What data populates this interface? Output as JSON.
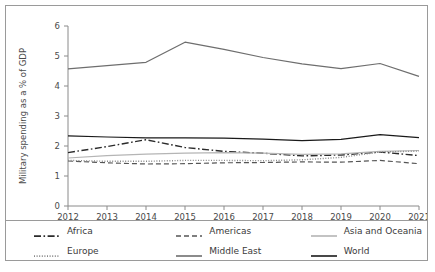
{
  "chart_data": {
    "type": "line",
    "title": "",
    "xlabel": "",
    "ylabel": "Military spending as a % of GDP",
    "x": [
      2012,
      2013,
      2014,
      2015,
      2016,
      2017,
      2018,
      2019,
      2020,
      2021
    ],
    "xticklabels": [
      "2012",
      "2013",
      "2014",
      "2015",
      "2016",
      "2017",
      "2018",
      "2019",
      "2020",
      "2021"
    ],
    "yticklabels": [
      "0",
      "1",
      "2",
      "3",
      "4",
      "5",
      "6"
    ],
    "ylim": [
      0,
      6
    ],
    "xlim": [
      2012,
      2021
    ],
    "grid": false,
    "legend_position": "bottom",
    "series": [
      {
        "name": "Africa",
        "style": "dash-dot",
        "color": "#2b2b2b",
        "values": [
          1.78,
          1.98,
          2.21,
          1.95,
          1.82,
          1.76,
          1.67,
          1.7,
          1.8,
          1.68
        ]
      },
      {
        "name": "Americas",
        "style": "dashed",
        "color": "#555555",
        "values": [
          1.5,
          1.44,
          1.4,
          1.41,
          1.44,
          1.45,
          1.47,
          1.46,
          1.52,
          1.41
        ]
      },
      {
        "name": "Asia and Oceania",
        "style": "solid",
        "color": "#b5b5b5",
        "values": [
          1.6,
          1.68,
          1.73,
          1.76,
          1.78,
          1.76,
          1.72,
          1.74,
          1.82,
          1.85
        ]
      },
      {
        "name": "Europe",
        "style": "dotted",
        "color": "#888888",
        "values": [
          1.52,
          1.49,
          1.49,
          1.52,
          1.52,
          1.51,
          1.54,
          1.62,
          1.8,
          1.83
        ]
      },
      {
        "name": "Middle East",
        "style": "solid",
        "color": "#6e6e6e",
        "values": [
          4.57,
          4.68,
          4.79,
          5.46,
          5.22,
          4.95,
          4.74,
          4.58,
          4.75,
          4.32
        ]
      },
      {
        "name": "World",
        "style": "solid",
        "color": "#1a1a1a",
        "values": [
          2.34,
          2.3,
          2.27,
          2.27,
          2.26,
          2.23,
          2.18,
          2.22,
          2.38,
          2.28
        ]
      }
    ]
  },
  "axis": {
    "ylabel": "Military spending as a % of GDP"
  },
  "legend": {
    "items": [
      {
        "label": "Africa"
      },
      {
        "label": "Americas"
      },
      {
        "label": "Asia and Oceania"
      },
      {
        "label": "Europe"
      },
      {
        "label": "Middle East"
      },
      {
        "label": "World"
      }
    ]
  }
}
